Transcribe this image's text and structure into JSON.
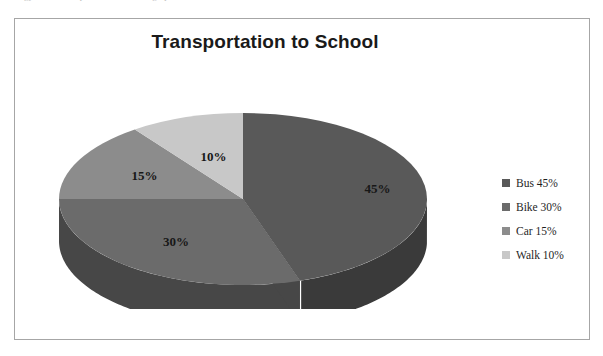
{
  "page": {
    "cut_off_text_fragments": [
      "gy",
      "p",
      "n the graph to as follows:"
    ]
  },
  "chart_frame": {
    "border_color": "#a6a6a6",
    "background": "#ffffff"
  },
  "chart_data": {
    "type": "pie",
    "title": "Transportation to School",
    "xlabel": "",
    "ylabel": "",
    "three_d": true,
    "start_angle_deg": 0,
    "direction": "clockwise",
    "categories": [
      "Bus",
      "Bike",
      "Car",
      "Walk"
    ],
    "values": [
      45,
      30,
      15,
      10
    ],
    "value_unit": "%",
    "data_labels": [
      "45%",
      "30%",
      "15%",
      "10%"
    ],
    "colors": [
      "#595959",
      "#6b6b6b",
      "#8c8c8c",
      "#c8c8c8"
    ],
    "side_colors": [
      "#3a3a3a",
      "#474747",
      "#5e5e5e",
      "#8f8f8f"
    ],
    "legend_position": "right",
    "legend": [
      {
        "label": "Bus 45%",
        "color": "#595959"
      },
      {
        "label": "Bike 30%",
        "color": "#6b6b6b"
      },
      {
        "label": "Car 15%",
        "color": "#8c8c8c"
      },
      {
        "label": "Walk 10%",
        "color": "#c8c8c8"
      }
    ],
    "grid": false
  }
}
